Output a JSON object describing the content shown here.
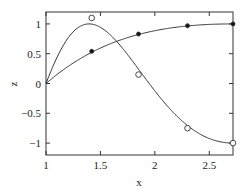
{
  "chart_data": {
    "type": "line",
    "title": "",
    "xlabel": "x",
    "ylabel": "z",
    "xlim": [
      1,
      2.718
    ],
    "ylim": [
      -1.2,
      1.2
    ],
    "x_ticks": [
      1,
      1.5,
      2,
      2.5
    ],
    "x_tick_labels": [
      "1",
      "1.5",
      "2",
      "2.5"
    ],
    "y_ticks": [
      -1,
      -0.5,
      0,
      0.5,
      1
    ],
    "y_tick_labels": [
      "−1",
      "−0.5",
      "0",
      "0.5",
      "1"
    ],
    "grid": false,
    "legend": null,
    "series": [
      {
        "name": "curve-1 (monotone, filled markers)",
        "curve": "z = sin(pi/2 * ln x)",
        "marker": "filled-circle",
        "points_x": [
          1.42,
          1.85,
          2.3,
          2.718
        ],
        "points_z": [
          0.54,
          0.83,
          0.97,
          1.0
        ]
      },
      {
        "name": "curve-2 (oscillating, open markers)",
        "curve": "z = sin(3*pi/2 * ln x)",
        "marker": "open-circle",
        "points_x": [
          1.42,
          1.85,
          2.3,
          2.718
        ],
        "points_z": [
          1.1,
          0.15,
          -0.75,
          -1.0
        ]
      }
    ]
  }
}
